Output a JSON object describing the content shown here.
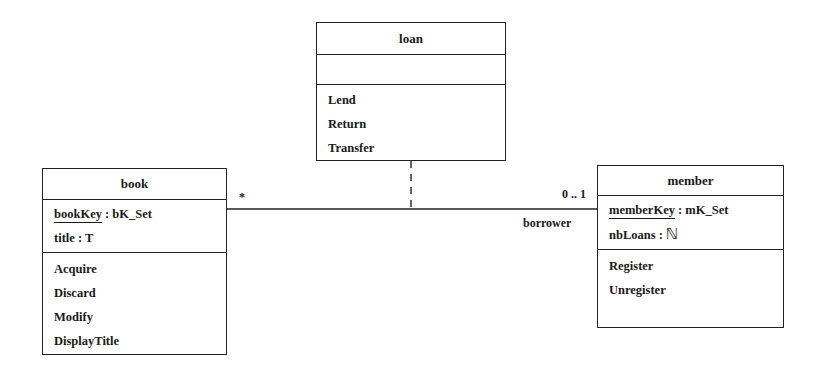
{
  "classes": {
    "loan": {
      "name": "loan",
      "attributes": [],
      "operations": [
        "Lend",
        "Return",
        "Transfer"
      ]
    },
    "book": {
      "name": "book",
      "attributes": [
        {
          "name": "bookKey",
          "type": ": bK_Set",
          "key": true
        },
        {
          "name": "title : T",
          "type": "",
          "key": false
        }
      ],
      "operations": [
        "Acquire",
        "Discard",
        "Modify",
        "DisplayTitle"
      ]
    },
    "member": {
      "name": "member",
      "attributes": [
        {
          "name": "memberKey",
          "type": ": mK_Set",
          "key": true
        },
        {
          "name": "nbLoans :",
          "type": "ℕ",
          "key": false
        }
      ],
      "operations": [
        "Register",
        "Unregister"
      ]
    }
  },
  "association": {
    "book_multiplicity": "*",
    "member_multiplicity": "0 .. 1",
    "member_role": "borrower",
    "association_class": "loan"
  },
  "colors": {
    "line": "#222222",
    "background": "#ffffff"
  }
}
